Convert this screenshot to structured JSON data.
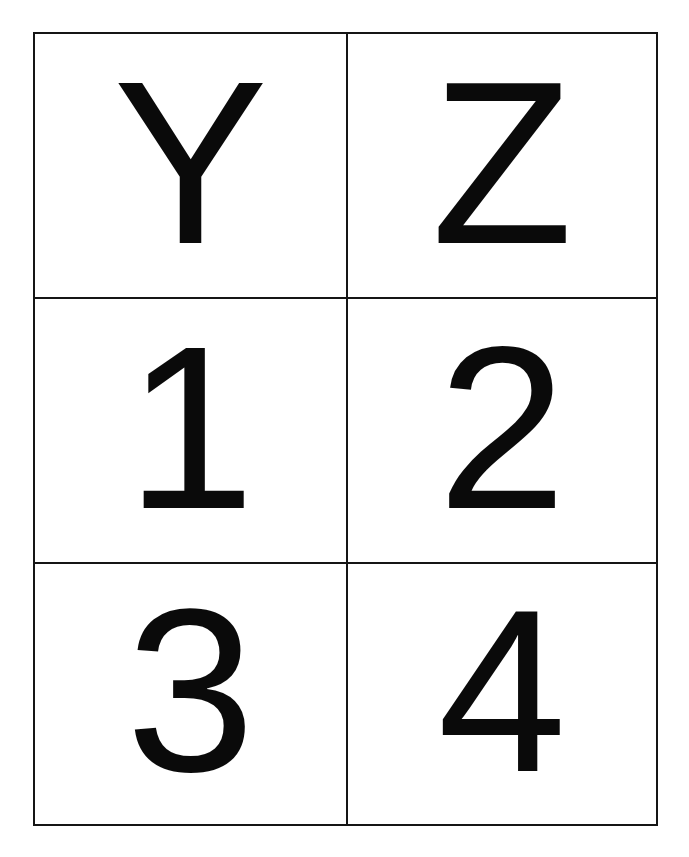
{
  "document": {
    "type": "letter-number-card-grid",
    "rows": 3,
    "columns": 2,
    "cells": [
      {
        "label": "Y"
      },
      {
        "label": "Z"
      },
      {
        "label": "1"
      },
      {
        "label": "2"
      },
      {
        "label": "3"
      },
      {
        "label": "4"
      }
    ]
  },
  "colors": {
    "line": "#151515",
    "glyph": "#0a0a0a",
    "background": "#ffffff"
  }
}
